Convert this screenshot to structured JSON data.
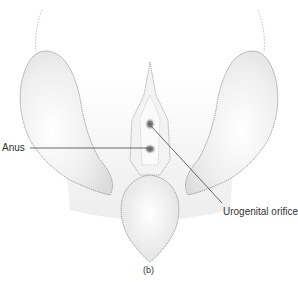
{
  "figure": {
    "caption": "(b)",
    "labels": {
      "anus": "Anus",
      "urogenital": "Urogenital orifice"
    }
  },
  "colors": {
    "outline": "#8a8a8a",
    "leader": "#444444",
    "orifice": "#6e6e6e",
    "text": "#333333"
  }
}
